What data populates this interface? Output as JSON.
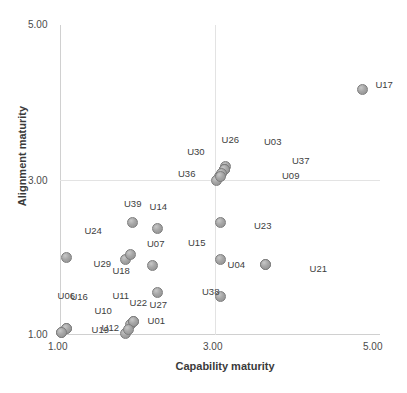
{
  "chart_data": {
    "type": "scatter",
    "title": "",
    "xlabel": "Capability maturity",
    "ylabel": "Alignment maturity",
    "xlim": [
      1.0,
      5.0
    ],
    "ylim": [
      1.0,
      5.0
    ],
    "xticks": [
      "1.00",
      "3.00",
      "5.00"
    ],
    "yticks": [
      "1.00",
      "3.00",
      "5.00"
    ],
    "xtick_values": [
      1.0,
      3.0,
      5.0
    ],
    "ytick_values": [
      1.0,
      3.0,
      5.0
    ],
    "grid": true,
    "legend": "none",
    "marker": "filled-gray-circle",
    "points": [
      {
        "label": "U17",
        "x": 4.78,
        "y": 4.17,
        "label_dx": 13,
        "label_dy": -5
      },
      {
        "label": "U26",
        "x": 3.07,
        "y": 3.17,
        "label_dx": -4,
        "label_dy": -28
      },
      {
        "label": "U03",
        "x": 3.05,
        "y": 3.14,
        "label_dx": 40,
        "label_dy": -28
      },
      {
        "label": "U30",
        "x": 2.99,
        "y": 3.05,
        "label_dx": -32,
        "label_dy": -25
      },
      {
        "label": "U36",
        "x": 2.95,
        "y": 2.99,
        "label_dx": -38,
        "label_dy": -8
      },
      {
        "label": "U37",
        "x": 3.05,
        "y": 3.14,
        "label_dx": 68,
        "label_dy": -9
      },
      {
        "label": "U09",
        "x": 3.05,
        "y": 3.14,
        "label_dx": 58,
        "label_dy": 6
      },
      {
        "label": "U39",
        "x": 1.9,
        "y": 2.45,
        "label_dx": -8,
        "label_dy": -20
      },
      {
        "label": "U14",
        "x": 2.22,
        "y": 2.38,
        "label_dx": -8,
        "label_dy": -22
      },
      {
        "label": "U23",
        "x": 3.0,
        "y": 2.45,
        "label_dx": 34,
        "label_dy": 2
      },
      {
        "label": "U24",
        "x": 1.08,
        "y": 2.0,
        "label_dx": 18,
        "label_dy": -28
      },
      {
        "label": "U07",
        "x": 2.15,
        "y": 1.9,
        "label_dx": -5,
        "label_dy": -22
      },
      {
        "label": "U29",
        "x": 1.82,
        "y": 1.98,
        "label_dx": -32,
        "label_dy": 4
      },
      {
        "label": "U18",
        "x": 1.88,
        "y": 2.04,
        "label_dx": -18,
        "label_dy": 16
      },
      {
        "label": "U15",
        "x": 3.0,
        "y": 1.97,
        "label_dx": -32,
        "label_dy": -18
      },
      {
        "label": "U04",
        "x": 3.57,
        "y": 1.91,
        "label_dx": -38,
        "label_dy": 0
      },
      {
        "label": "U21",
        "x": 3.57,
        "y": 1.91,
        "label_dx": 44,
        "label_dy": 4
      },
      {
        "label": "U22",
        "x": 2.22,
        "y": 1.55,
        "label_dx": -28,
        "label_dy": 10
      },
      {
        "label": "U38",
        "x": 3.0,
        "y": 1.5,
        "label_dx": -18,
        "label_dy": -5
      },
      {
        "label": "U06",
        "x": 1.02,
        "y": 1.03,
        "label_dx": -4,
        "label_dy": -38
      },
      {
        "label": "U16",
        "x": 1.08,
        "y": 1.09,
        "label_dx": 4,
        "label_dy": -32
      },
      {
        "label": "U10",
        "x": 1.08,
        "y": 1.09,
        "label_dx": 28,
        "label_dy": -18
      },
      {
        "label": "U19",
        "x": 1.02,
        "y": 1.03,
        "label_dx": 30,
        "label_dy": -4
      },
      {
        "label": "U11",
        "x": 1.88,
        "y": 1.13,
        "label_dx": -18,
        "label_dy": -30
      },
      {
        "label": "U12",
        "x": 1.82,
        "y": 1.02,
        "label_dx": -24,
        "label_dy": -6
      },
      {
        "label": "U27",
        "x": 1.92,
        "y": 1.17,
        "label_dx": 16,
        "label_dy": -18
      },
      {
        "label": "U01",
        "x": 1.92,
        "y": 1.17,
        "label_dx": 14,
        "label_dy": -2
      }
    ],
    "extra_markers": [
      {
        "x": 3.02,
        "y": 3.09
      },
      {
        "x": 3.0,
        "y": 3.04
      },
      {
        "x": 1.85,
        "y": 1.07
      }
    ]
  }
}
